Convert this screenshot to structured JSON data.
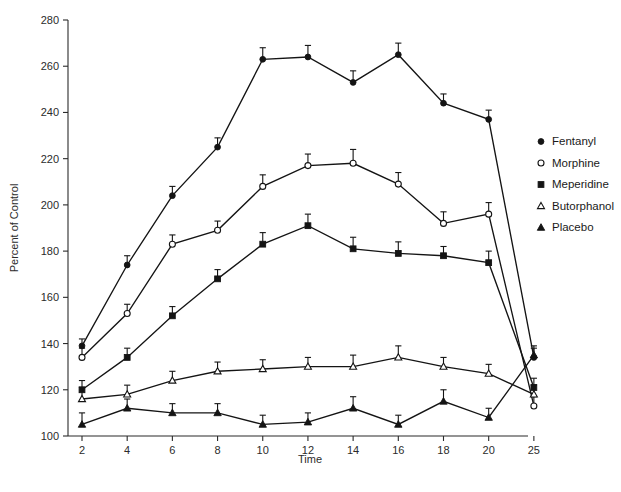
{
  "chart_data": {
    "type": "line",
    "title": "",
    "xlabel": "Time",
    "ylabel": "Percent of Control",
    "grid": false,
    "legend_position": "right",
    "xlim": [
      0,
      10
    ],
    "ylim": [
      100,
      280
    ],
    "y_ticks": [
      100,
      120,
      140,
      160,
      180,
      200,
      220,
      240,
      260,
      280
    ],
    "x_ticks": [
      2,
      4,
      6,
      8,
      10,
      12,
      14,
      16,
      18,
      20,
      25
    ],
    "x_tick_labels": [
      "2",
      "4",
      "6",
      "8",
      "10",
      "12",
      "14",
      "16",
      "18",
      "20",
      "25"
    ],
    "x_axis_note": "categorical-like spacing; 25 placed one step after 20",
    "categories": [
      2,
      4,
      6,
      8,
      10,
      12,
      14,
      16,
      18,
      20,
      25
    ],
    "series": [
      {
        "name": "Fentanyl",
        "marker": "filled-circle",
        "values": [
          139,
          174,
          204,
          225,
          263,
          264,
          253,
          265,
          244,
          237,
          134
        ],
        "errors": [
          3,
          4,
          4,
          4,
          5,
          5,
          5,
          5,
          4,
          4,
          4
        ]
      },
      {
        "name": "Morphine",
        "marker": "open-circle",
        "values": [
          134,
          153,
          183,
          189,
          208,
          217,
          218,
          209,
          192,
          196,
          113
        ],
        "errors": [
          4,
          4,
          4,
          4,
          5,
          5,
          6,
          5,
          5,
          5,
          4
        ]
      },
      {
        "name": "Meperidine",
        "marker": "filled-square",
        "values": [
          120,
          134,
          152,
          168,
          183,
          191,
          181,
          179,
          178,
          175,
          121
        ],
        "errors": [
          4,
          4,
          4,
          4,
          5,
          5,
          5,
          5,
          4,
          5,
          4
        ]
      },
      {
        "name": "Butorphanol",
        "marker": "open-triangle",
        "values": [
          116,
          118,
          124,
          128,
          129,
          130,
          130,
          134,
          130,
          127,
          118
        ],
        "errors": [
          5,
          4,
          4,
          4,
          4,
          4,
          5,
          5,
          4,
          4,
          4
        ]
      },
      {
        "name": "Placebo",
        "marker": "filled-triangle",
        "values": [
          105,
          112,
          110,
          110,
          105,
          106,
          112,
          105,
          115,
          108,
          135
        ],
        "errors": [
          5,
          4,
          4,
          4,
          4,
          4,
          5,
          4,
          5,
          4,
          4
        ]
      }
    ]
  },
  "legend": {
    "items": [
      {
        "label": "Fentanyl",
        "marker": "filled-circle"
      },
      {
        "label": "Morphine",
        "marker": "open-circle"
      },
      {
        "label": "Meperidine",
        "marker": "filled-square"
      },
      {
        "label": "Butorphanol",
        "marker": "open-triangle"
      },
      {
        "label": "Placebo",
        "marker": "filled-triangle"
      }
    ]
  },
  "axes": {
    "x_title": "Time",
    "y_title": "Percent of Control"
  }
}
